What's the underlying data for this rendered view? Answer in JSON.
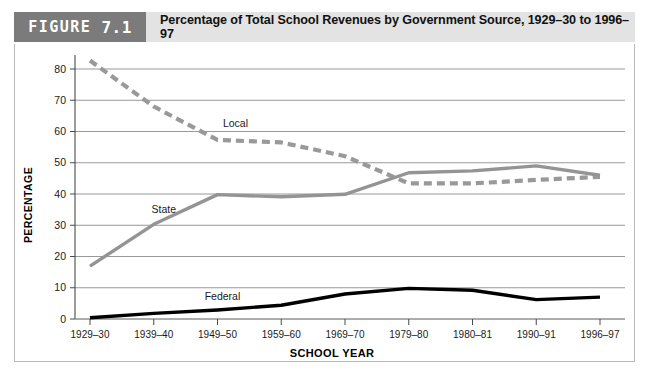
{
  "header": {
    "figure_word": "FIGURE",
    "figure_number": "7.1",
    "title": "Percentage of Total School Revenues by Government Source, 1929–30 to 1996–97",
    "tag_bg": "#7b7b7b",
    "bar_bg": "#e3e3e3"
  },
  "chart_data": {
    "type": "line",
    "title": "Percentage of Total School Revenues by Government Source, 1929–30 to 1996–97",
    "xlabel": "SCHOOL YEAR",
    "ylabel": "PERCENTAGE",
    "ylim": [
      0,
      85
    ],
    "yticks": [
      0,
      10,
      20,
      30,
      40,
      50,
      60,
      70,
      80
    ],
    "grid": true,
    "legend_position": "inline-labels",
    "categories": [
      "1929–30",
      "1939–40",
      "1949–50",
      "1959–60",
      "1969–70",
      "1979–80",
      "1980–81",
      "1990–91",
      "1996–97"
    ],
    "series": [
      {
        "name": "Local",
        "style": "dashed",
        "color": "#999999",
        "label_x_index": 2,
        "values": [
          82.7,
          68.0,
          57.3,
          56.5,
          52.1,
          43.4,
          43.4,
          44.5,
          45.5
        ]
      },
      {
        "name": "State",
        "style": "solid",
        "color": "#949494",
        "label_x_index": 1,
        "values": [
          16.9,
          30.3,
          39.8,
          39.1,
          39.9,
          46.8,
          47.4,
          49.0,
          46.0
        ]
      },
      {
        "name": "Federal",
        "style": "solid",
        "color": "#000000",
        "label_x_index": 2,
        "values": [
          0.4,
          1.8,
          2.9,
          4.4,
          8.0,
          9.8,
          9.2,
          6.2,
          7.0
        ]
      }
    ]
  }
}
